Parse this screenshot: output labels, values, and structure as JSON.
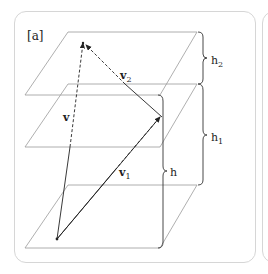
{
  "panel": {
    "label": "[a]"
  },
  "vectors": {
    "v": {
      "name": "v",
      "sub": ""
    },
    "v1": {
      "name": "v",
      "sub": "1"
    },
    "v2": {
      "name": "v",
      "sub": "2"
    }
  },
  "heights": {
    "h": {
      "name": "h",
      "sub": ""
    },
    "h1": {
      "name": "h",
      "sub": "1"
    },
    "h2": {
      "name": "h",
      "sub": "2"
    }
  },
  "colors": {
    "plane": "#9a9a9a",
    "vector": "#222222",
    "frame": "#d6d6d6"
  }
}
